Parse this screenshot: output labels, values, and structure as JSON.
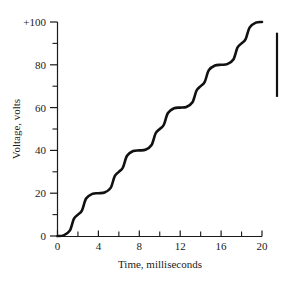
{
  "chart_data": {
    "type": "line",
    "title": "",
    "subtitle": "",
    "xlabel": "Time, milliseconds",
    "ylabel": "Voltage, volts",
    "xlim": [
      0,
      20
    ],
    "ylim": [
      0,
      100
    ],
    "grid": false,
    "legend": false,
    "legend_position": "none",
    "x_ticks_major": [
      0,
      4,
      8,
      12,
      16,
      20
    ],
    "x_tick_labels": [
      "0",
      "4",
      "8",
      "12",
      "16",
      "20"
    ],
    "x_ticks_minor": [
      2,
      6,
      10,
      14,
      18
    ],
    "y_ticks_major": [
      0,
      20,
      40,
      60,
      80,
      100
    ],
    "y_tick_labels": [
      "0",
      "20",
      "40",
      "60",
      "80",
      "+100"
    ],
    "y_ticks_minor": [
      10,
      30,
      50,
      70,
      90
    ],
    "series": [
      {
        "name": "Staircase voltage",
        "color": "#111111",
        "description": "Smoothed staircase waveform rising in five 20-volt steps",
        "step_plateau_values": [
          0,
          20,
          40,
          60,
          80,
          100
        ],
        "step_transition_centers": [
          2,
          6,
          10,
          14,
          18
        ],
        "x": [
          0,
          0.6,
          1.2,
          1.6,
          2.0,
          2.4,
          2.8,
          3.4,
          4.0,
          4.6,
          5.2,
          5.6,
          6.0,
          6.4,
          6.8,
          7.4,
          8.0,
          8.6,
          9.2,
          9.6,
          10.0,
          10.4,
          10.8,
          11.4,
          12.0,
          12.6,
          13.2,
          13.6,
          14.0,
          14.4,
          14.8,
          15.4,
          16.0,
          16.6,
          17.2,
          17.6,
          18.0,
          18.4,
          18.8,
          19.4,
          20.0
        ],
        "y": [
          0,
          0.3,
          2.5,
          8.0,
          10.0,
          12.0,
          17.5,
          19.7,
          20,
          20.3,
          22.5,
          28.0,
          30.0,
          32.0,
          37.5,
          39.7,
          40,
          40.3,
          42.5,
          48.0,
          50.0,
          52.0,
          57.5,
          59.7,
          60,
          60.3,
          62.5,
          68.0,
          70.0,
          72.0,
          77.5,
          79.7,
          80,
          80.3,
          82.5,
          88.0,
          90.0,
          92.0,
          97.5,
          99.7,
          100
        ]
      }
    ],
    "annotations": [
      {
        "name": "right-scale-bar",
        "type": "vertical-rule",
        "value_span": [
          65,
          95
        ]
      }
    ]
  },
  "axes": {
    "y_axis_name": "voltage-axis",
    "x_axis_name": "time-axis"
  }
}
